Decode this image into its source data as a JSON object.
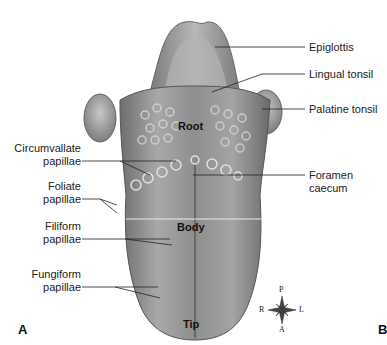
{
  "figure": {
    "panel_labels": [
      "A",
      "B"
    ],
    "regions": {
      "root": "Root",
      "body": "Body",
      "tip": "Tip"
    },
    "right_labels": {
      "epiglottis": "Epiglottis",
      "lingual_tonsil": "Lingual tonsil",
      "palatine_tonsil": "Palatine tonsil",
      "foramen_caecum_1": "Foramen",
      "foramen_caecum_2": "caecum"
    },
    "left_labels": {
      "circumvallate_1": "Circumvallate",
      "circumvallate_2": "papillae",
      "foliate_1": "Foliate",
      "foliate_2": "papillae",
      "filiform_1": "Filiform",
      "filiform_2": "papillae",
      "fungiform_1": "Fungiform",
      "fungiform_2": "papillae"
    },
    "compass": {
      "top": "P",
      "bottom": "A",
      "left": "R",
      "right": "L"
    }
  }
}
